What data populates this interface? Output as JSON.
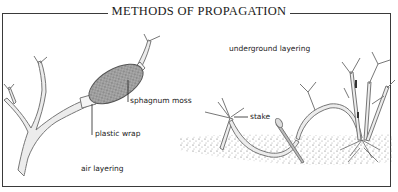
{
  "title": "METHODS OF PROPAGATION",
  "labels": {
    "sphagnum_moss": "sphagnum moss",
    "plastic_wrap": "plastic wrap",
    "air_layering": "air layering",
    "underground_layering": "underground layering",
    "stake": "stake"
  },
  "colors": {
    "border": "#3a3a3a",
    "stem": "#e8e8e8",
    "stem_outline": "#777777",
    "moss": "#8a8a8a",
    "soil": "#9a9a9a"
  }
}
